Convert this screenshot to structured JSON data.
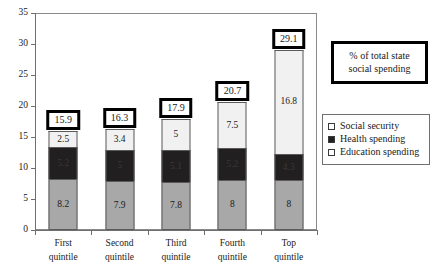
{
  "chart_data": {
    "type": "bar",
    "subtype": "stacked-column",
    "title": "",
    "xlabel": "",
    "ylabel": "",
    "ylim": [
      0,
      35
    ],
    "ytick_step": 5,
    "yticks": [
      "0",
      "5",
      "10",
      "15",
      "20",
      "25",
      "30",
      "35"
    ],
    "grid": false,
    "legend_position": "right",
    "categories": [
      "First quintile",
      "Second quintile",
      "Third quintile",
      "Fourth quintile",
      "Top quintile"
    ],
    "category_lines": [
      [
        "First",
        "quintile"
      ],
      [
        "Second",
        "quintile"
      ],
      [
        "Third",
        "quintile"
      ],
      [
        "Fourth",
        "quintile"
      ],
      [
        "Top",
        "quintile"
      ]
    ],
    "series": [
      {
        "name": "Social security",
        "color": "#f1f1f1",
        "values": [
          2.5,
          3.4,
          5,
          7.5,
          16.8
        ],
        "labels": [
          "2.5",
          "3.4",
          "5",
          "7.5",
          "16.8"
        ]
      },
      {
        "name": "Health spending",
        "color": "#211f1f",
        "values": [
          5.2,
          5,
          5.1,
          5.2,
          4.3
        ],
        "labels": [
          "5.2",
          "5",
          "5.1",
          "5.2",
          "4.3"
        ]
      },
      {
        "name": "Education spending",
        "color": "#a8a8a8",
        "values": [
          8.2,
          7.9,
          7.8,
          8,
          8
        ],
        "labels": [
          "8.2",
          "7.9",
          "7.8",
          "8",
          "8"
        ]
      }
    ],
    "totals": [
      15.9,
      16.3,
      17.9,
      20.7,
      29.1
    ],
    "total_labels": [
      "15.9",
      "16.3",
      "17.9",
      "20.7",
      "29.1"
    ],
    "annotation": {
      "line1": "% of total state",
      "line2": "social spending"
    }
  },
  "legend": {
    "items": [
      {
        "label": "Social security",
        "swatch": "social"
      },
      {
        "label": "Health spending",
        "swatch": "health"
      },
      {
        "label": "Education spending",
        "swatch": "education"
      }
    ]
  }
}
